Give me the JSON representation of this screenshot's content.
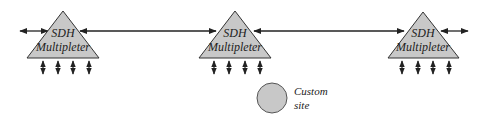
{
  "diagram": {
    "type": "network-topology",
    "colors": {
      "node_fill": "#c8c8c8",
      "stroke": "#222222",
      "background": "#ffffff"
    },
    "nodes": [
      {
        "id": "mux-left",
        "shape": "triangle",
        "line1": "SDH",
        "line2": "Multipleter",
        "tributaries": 4
      },
      {
        "id": "mux-middle",
        "shape": "triangle",
        "line1": "SDH",
        "line2": "Multipleter",
        "tributaries": 4
      },
      {
        "id": "mux-right",
        "shape": "triangle",
        "line1": "SDH",
        "line2": "Multipleter",
        "tributaries": 4
      },
      {
        "id": "custom-site",
        "shape": "circle",
        "line1": "Custom",
        "line2": "site"
      }
    ],
    "links": [
      {
        "from": "external-left",
        "to": "mux-left",
        "direction": "bidirectional"
      },
      {
        "from": "mux-left",
        "to": "mux-middle",
        "direction": "bidirectional"
      },
      {
        "from": "mux-middle",
        "to": "mux-right",
        "direction": "bidirectional"
      },
      {
        "from": "mux-right",
        "to": "external-right",
        "direction": "bidirectional"
      }
    ]
  }
}
